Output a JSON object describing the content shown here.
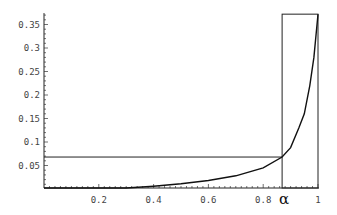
{
  "chart_data": {
    "type": "line",
    "title": "",
    "xlabel": "",
    "ylabel": "",
    "xlim": [
      0,
      1
    ],
    "ylim": [
      0,
      0.37
    ],
    "grid": false,
    "x_ticks": [
      "0.2",
      "0.4",
      "0.6",
      "0.8",
      "1"
    ],
    "x_tick_values": [
      0.2,
      0.4,
      0.6,
      0.8,
      1.0
    ],
    "y_ticks": [
      "0.05",
      "0.1",
      "0.15",
      "0.2",
      "0.25",
      "0.3",
      "0.35"
    ],
    "y_tick_values": [
      0.05,
      0.1,
      0.15,
      0.2,
      0.25,
      0.3,
      0.35
    ],
    "annotations": {
      "alpha_label": "α",
      "alpha_x": 0.869,
      "horizontal_line_y": 0.068,
      "rectangle": {
        "x0": 0.869,
        "x1": 1.0,
        "y0": 0,
        "y1": 0.372
      }
    },
    "series": [
      {
        "name": "curve",
        "x": [
          0.0,
          0.1,
          0.2,
          0.3,
          0.4,
          0.5,
          0.6,
          0.7,
          0.8,
          0.869,
          0.9,
          0.93,
          0.95,
          0.97,
          0.985,
          1.0
        ],
        "y": [
          0.0,
          0.0005,
          0.001,
          0.002,
          0.006,
          0.011,
          0.018,
          0.028,
          0.045,
          0.068,
          0.088,
          0.13,
          0.16,
          0.22,
          0.28,
          0.372
        ]
      }
    ]
  }
}
